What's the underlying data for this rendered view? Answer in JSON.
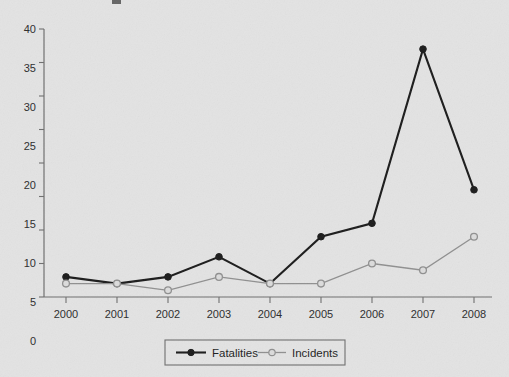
{
  "chart_data": {
    "type": "line",
    "title": "",
    "xlabel": "",
    "ylabel": "",
    "categories": [
      "2000",
      "2001",
      "2002",
      "2003",
      "2004",
      "2005",
      "2006",
      "2007",
      "2008"
    ],
    "series": [
      {
        "name": "Fatalities",
        "values": [
          3,
          2,
          3,
          6,
          2,
          9,
          11,
          37,
          16
        ],
        "color": "#1a1a1a",
        "marker": "filled-circle"
      },
      {
        "name": "Incidents",
        "values": [
          2,
          2,
          1,
          3,
          2,
          2,
          5,
          4,
          9
        ],
        "color": "#8f8f8f",
        "marker": "open-circle"
      }
    ],
    "ylim": [
      0,
      40
    ],
    "yticks": [
      "0",
      "5",
      "10",
      "15",
      "20",
      "25",
      "30",
      "35",
      "40"
    ],
    "xticks": [
      "2000",
      "2001",
      "2002",
      "2003",
      "2004",
      "2005",
      "2006",
      "2007",
      "2008"
    ],
    "grid": false,
    "legend_position": "bottom-center",
    "background_color": "#e3e3e3",
    "axis_color": "#6e6e6e"
  },
  "legend": {
    "entries": [
      {
        "label": "Fatalities",
        "marker": "filled-circle-marker"
      },
      {
        "label": "Incidents",
        "marker": "open-circle-marker"
      }
    ]
  }
}
